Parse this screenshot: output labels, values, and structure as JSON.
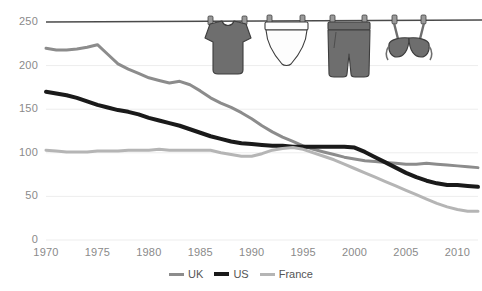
{
  "chart_data": {
    "type": "line",
    "title": "",
    "xlabel": "",
    "ylabel": "",
    "xlim": [
      1970,
      2012
    ],
    "ylim": [
      0,
      250
    ],
    "grid": true,
    "legend_position": "bottom",
    "ytick_labels": [
      "250",
      "200",
      "150",
      "100",
      "50",
      "0"
    ],
    "ytick_values": [
      250,
      200,
      150,
      100,
      50,
      0
    ],
    "xtick_labels": [
      "1970",
      "1975",
      "1980",
      "1985",
      "1990",
      "1995",
      "2000",
      "2005",
      "2010"
    ],
    "xtick_values": [
      1970,
      1975,
      1980,
      1985,
      1990,
      1995,
      2000,
      2005,
      2010
    ],
    "x": [
      1970,
      1971,
      1972,
      1973,
      1974,
      1975,
      1976,
      1977,
      1978,
      1979,
      1980,
      1981,
      1982,
      1983,
      1984,
      1985,
      1986,
      1987,
      1988,
      1989,
      1990,
      1991,
      1992,
      1993,
      1994,
      1995,
      1996,
      1997,
      1998,
      1999,
      2000,
      2001,
      2002,
      2003,
      2004,
      2005,
      2006,
      2007,
      2008,
      2009,
      2010,
      2011,
      2012
    ],
    "series": [
      {
        "name": "UK",
        "color": "#8c8c8c",
        "width": 3,
        "values": [
          220,
          218,
          218,
          219,
          221,
          224,
          213,
          202,
          196,
          191,
          186,
          183,
          180,
          182,
          178,
          171,
          163,
          157,
          152,
          146,
          139,
          131,
          124,
          118,
          113,
          108,
          104,
          101,
          98,
          95,
          93,
          91,
          90,
          89,
          88,
          87,
          87,
          88,
          87,
          86,
          85,
          84,
          83
        ]
      },
      {
        "name": "US",
        "color": "#1a1a1a",
        "width": 4,
        "values": [
          170,
          168,
          166,
          163,
          159,
          155,
          152,
          149,
          147,
          144,
          140,
          137,
          134,
          131,
          127,
          123,
          119,
          116,
          113,
          111,
          110,
          109,
          108,
          108,
          107,
          107,
          107,
          107,
          107,
          107,
          106,
          101,
          95,
          89,
          83,
          77,
          72,
          68,
          65,
          63,
          63,
          62,
          61
        ]
      },
      {
        "name": "France",
        "color": "#b5b5b5",
        "width": 3,
        "values": [
          103,
          102,
          101,
          101,
          101,
          102,
          102,
          102,
          103,
          103,
          103,
          104,
          103,
          103,
          103,
          103,
          103,
          100,
          98,
          96,
          96,
          99,
          103,
          105,
          106,
          104,
          100,
          96,
          92,
          87,
          82,
          77,
          72,
          67,
          62,
          57,
          52,
          47,
          42,
          38,
          35,
          33,
          33
        ]
      }
    ],
    "clothesline": {
      "value": 250,
      "color": "#4a4a4a",
      "garments": [
        {
          "name": "t-shirt",
          "fill": "#6e6e6e",
          "stroke": "#3d3d3d"
        },
        {
          "name": "underwear",
          "fill": "#fdfdfd",
          "stroke": "#3d3d3d"
        },
        {
          "name": "pants",
          "fill": "#6e6e6e",
          "stroke": "#3d3d3d"
        },
        {
          "name": "bra",
          "fill": "#6e6e6e",
          "stroke": "#3d3d3d"
        }
      ]
    }
  }
}
